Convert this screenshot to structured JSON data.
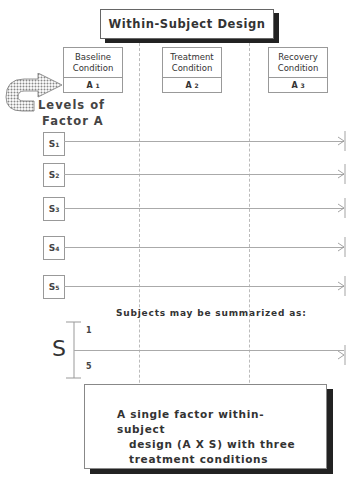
{
  "title": "Within-Subject Design",
  "conditions": [
    {
      "name_line1": "Baseline",
      "name_line2": "Condition",
      "level": "A",
      "sub": "1"
    },
    {
      "name_line1": "Treatment",
      "name_line2": "Condition",
      "level": "A",
      "sub": "2"
    },
    {
      "name_line1": "Recovery",
      "name_line2": "Condition",
      "level": "A",
      "sub": "3"
    }
  ],
  "factor_label": {
    "line1": "Levels of",
    "line2": "Factor A"
  },
  "subjects": [
    {
      "label": "S",
      "sub": "1"
    },
    {
      "label": "S",
      "sub": "2"
    },
    {
      "label": "S",
      "sub": "3"
    },
    {
      "label": "S",
      "sub": "4"
    },
    {
      "label": "S",
      "sub": "5"
    }
  ],
  "summary": {
    "caption": "Subjects may be summarized as:",
    "symbol": "S",
    "top": "1",
    "bottom": "5"
  },
  "description": {
    "line1": "A single factor within-subject",
    "line2": "design (A X S) with three",
    "line3": "treatment conditions"
  },
  "colors": {
    "shadow": "#222222",
    "lines": "#aaaaaa",
    "hatch": "#888888"
  }
}
